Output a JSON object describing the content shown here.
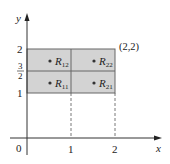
{
  "diagram": {
    "axes": {
      "x_label": "x",
      "y_label": "y",
      "origin_label": "0",
      "x_ticks": [
        "1",
        "2"
      ],
      "y_ticks": [
        "1",
        "2"
      ],
      "y_fraction_tick": {
        "numerator": "3",
        "denominator": "2"
      }
    },
    "corner_label": "(2,2)",
    "regions": [
      {
        "letter": "R",
        "sub": "12"
      },
      {
        "letter": "R",
        "sub": "22"
      },
      {
        "letter": "R",
        "sub": "11"
      },
      {
        "letter": "R",
        "sub": "21"
      }
    ],
    "colors": {
      "fill": "#d3d3d3",
      "stroke": "#555555",
      "axis": "#333333"
    }
  }
}
